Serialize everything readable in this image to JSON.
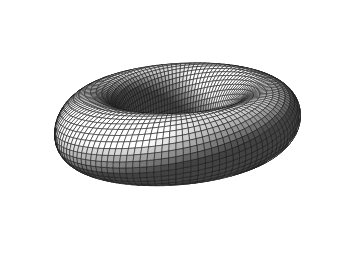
{
  "figure": {
    "title": "Twisted Torus",
    "subtitle": "Toroidal spiral surface with quadrilateral wireframe mesh",
    "domain_kind": "3d-parametric-surface-render",
    "background_color": "#ffffff",
    "width": 350,
    "height": 253,
    "object_bbox": {
      "x": 12,
      "y": 9,
      "width": 326,
      "height": 227
    },
    "caption_text": "Grayscale shaded rendering of a self-intersecting twisted torus"
  },
  "render": {
    "style": "flat-shaded-quads-with-wireframe",
    "wireframe_color": "#1b1b1b",
    "wireframe_width": 0.55,
    "silhouette_color": "#111111",
    "shading_model": "lambert-diffuse-plus-ambient",
    "ambient": 0.17,
    "diffuse": 0.95,
    "specular": 0.34,
    "specular_power": 11,
    "gray_min_hex": "#1e1e1e",
    "gray_mid_hex": "#8a8a8a",
    "gray_max_hex": "#ffffff",
    "light_direction": [
      -0.32,
      -0.62,
      0.72
    ],
    "highlight_bands": "bright white bands on lower-right outer rim and inner upper-left rim",
    "dark_regions": "inner tunnel of the hole and upper-right outer shoulder"
  },
  "chart_data": {
    "type": "surface",
    "title": "Twisted Torus",
    "surface_equation": "toroidal spiral: tube of radius r swept along a circle of radius R with a 1-turn twist of the cross-section",
    "parameters": {
      "major_radius_R": 1.0,
      "minor_radius_r": 0.4,
      "tube_cross_section_radius": 0.16,
      "twist_turns": 1,
      "vertical_pitch": 0.33
    },
    "u_range": [
      0,
      6.283185307179586
    ],
    "v_range": [
      0,
      6.283185307179586
    ],
    "u_samples": 120,
    "v_samples": 34,
    "camera": {
      "azimuth_deg": -18,
      "elevation_deg": 28,
      "roll_deg": 0,
      "projection": "perspective",
      "focal_length": 5.6,
      "distance": 5.0,
      "screen_scale": 168,
      "center_x": 176,
      "center_y": 120
    },
    "axes": {
      "visible": false
    },
    "grid": {
      "visible": false
    },
    "legend": {
      "visible": false
    },
    "tick_labels": [],
    "annotations": []
  }
}
